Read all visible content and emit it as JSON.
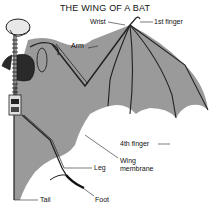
{
  "title": "THE WING OF A BAT",
  "labels": {
    "wrist": "Wrist",
    "first_finger": "1st finger",
    "arm": "Arm",
    "fourth_finger": "4th finger",
    "wing_membrane_line1": "Wing",
    "wing_membrane_line2": "membrane",
    "leg": "Leg",
    "tail": "Tail",
    "foot": "Foot"
  },
  "colors": {
    "membrane": "#9a9a9a",
    "bone": "#222222",
    "background": "#ffffff"
  }
}
